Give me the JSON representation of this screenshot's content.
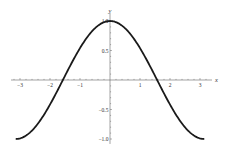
{
  "chart_data": {
    "type": "line",
    "title": "",
    "function": "cos(x)",
    "xlabel": "x",
    "ylabel": "y",
    "xlim": [
      -3.3,
      3.4
    ],
    "ylim": [
      -1.05,
      1.05
    ],
    "xticks": [
      -3,
      -2,
      -1,
      1,
      2,
      3
    ],
    "xtick_labels": [
      "−3",
      "−2",
      "−1",
      "1",
      "2",
      "3"
    ],
    "yticks": [
      -1.0,
      -0.5,
      0.5,
      1.0
    ],
    "ytick_labels": [
      "−1.0",
      "−0.5",
      "0.5",
      "1.0"
    ],
    "x_minor_step": 0.2,
    "y_minor_step": 0.1,
    "grid": false,
    "legend": "none",
    "series": [
      {
        "name": "cos(x)",
        "color": "#1a1a1a",
        "x_range": [
          -3.14159,
          3.14159
        ],
        "points": [
          [
            -3.14159,
            -1.0
          ],
          [
            -2.5,
            -0.801
          ],
          [
            -2.0,
            -0.416
          ],
          [
            -1.5708,
            0.0
          ],
          [
            -1.0,
            0.54
          ],
          [
            -0.5,
            0.878
          ],
          [
            0.0,
            1.0
          ],
          [
            0.5,
            0.878
          ],
          [
            1.0,
            0.54
          ],
          [
            1.5708,
            0.0
          ],
          [
            2.0,
            -0.416
          ],
          [
            2.5,
            -0.801
          ],
          [
            3.14159,
            -1.0
          ]
        ]
      }
    ]
  }
}
